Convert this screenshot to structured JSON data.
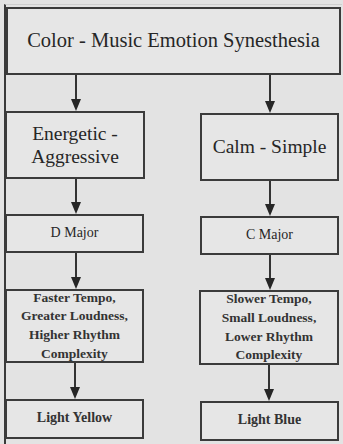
{
  "diagram": {
    "title": "Color - Music Emotion Synesthesia",
    "left_branch": {
      "emotion": "Energetic - Aggressive",
      "emotion_lines": [
        "Energetic -",
        "Aggressive"
      ],
      "key": "D Major",
      "features_lines": [
        "Faster Tempo,",
        "Greater Loudness,",
        "Higher Rhythm",
        "Complexity"
      ],
      "color": "Light Yellow"
    },
    "right_branch": {
      "emotion": "Calm - Simple",
      "key": "C Major",
      "features_lines": [
        "Slower Tempo,",
        "Small Loudness,",
        "Lower Rhythm",
        "Complexity"
      ],
      "color": "Light Blue"
    },
    "edges": [
      {
        "from": "Color - Music Emotion Synesthesia",
        "to": "Energetic - Aggressive"
      },
      {
        "from": "Color - Music Emotion Synesthesia",
        "to": "Calm - Simple"
      },
      {
        "from": "Energetic - Aggressive",
        "to": "D Major"
      },
      {
        "from": "Calm - Simple",
        "to": "C Major"
      },
      {
        "from": "D Major",
        "to": "Faster Tempo, Greater Loudness, Higher Rhythm Complexity"
      },
      {
        "from": "C Major",
        "to": "Slower Tempo, Small Loudness, Lower Rhythm Complexity"
      },
      {
        "from": "Faster Tempo, Greater Loudness, Higher Rhythm Complexity",
        "to": "Light Yellow"
      },
      {
        "from": "Slower Tempo, Small Loudness, Lower Rhythm Complexity",
        "to": "Light Blue"
      }
    ]
  }
}
